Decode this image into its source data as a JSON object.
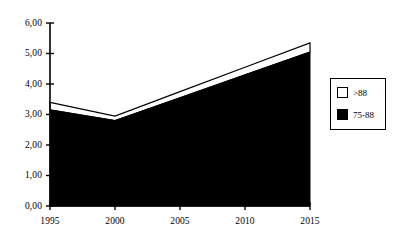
{
  "chart_data": {
    "type": "area",
    "title": "",
    "subtitle": "",
    "xlabel": "",
    "ylabel": "",
    "stacked": true,
    "grid": false,
    "legend_position": "right",
    "categories": [
      "1995",
      "2000",
      "2005",
      "2010",
      "2015"
    ],
    "x": [
      1995,
      2000,
      2005,
      2010,
      2015
    ],
    "xlim": [
      1995,
      2015
    ],
    "ylim": [
      0.0,
      6.0
    ],
    "y_ticks": [
      0.0,
      1.0,
      2.0,
      3.0,
      4.0,
      5.0,
      6.0
    ],
    "y_tick_labels": [
      "0,00",
      "1,00",
      "2,00",
      "3,00",
      "4,00",
      "5,00",
      "6,00"
    ],
    "x_tick_labels": [
      "1995",
      "2000",
      "2005",
      "2010",
      "2015"
    ],
    "decimal_separator": ",",
    "series": [
      {
        "name": "75-88",
        "color": "#000000",
        "values": [
          3.15,
          2.8,
          3.55,
          4.3,
          5.05
        ]
      },
      {
        "name": ">88",
        "color": "#ffffff",
        "values": [
          0.25,
          0.15,
          0.2,
          0.25,
          0.3
        ]
      }
    ],
    "cumulative_totals": [
      3.4,
      2.95,
      3.75,
      4.55,
      5.35
    ]
  },
  "legend": {
    "items": [
      {
        "label": ">88",
        "swatch": "#ffffff"
      },
      {
        "label": "75-88",
        "swatch": "#000000"
      }
    ]
  },
  "axes": {
    "y_labels": [
      "6,00",
      "5,00",
      "4,00",
      "3,00",
      "2,00",
      "1,00",
      "0,00"
    ],
    "x_labels": [
      "1995",
      "2000",
      "2005",
      "2010",
      "2015"
    ]
  }
}
